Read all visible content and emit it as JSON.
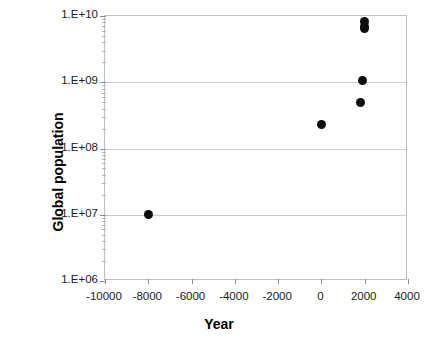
{
  "chart_data": {
    "type": "scatter",
    "title": "",
    "xlabel": "Year",
    "ylabel": "Global population",
    "yscale": "log",
    "xscale": "linear",
    "xlim": [
      -10000,
      4000
    ],
    "ylim": [
      1000000,
      10000000000
    ],
    "grid": true,
    "legend": false,
    "x_tick_labels": [
      "-10000",
      "-8000",
      "-6000",
      "-4000",
      "-2000",
      "0",
      "2000",
      "4000"
    ],
    "x_ticks": [
      -10000,
      -8000,
      -6000,
      -4000,
      -2000,
      0,
      2000,
      4000
    ],
    "y_tick_labels": [
      "1.E+10",
      "1.E+09",
      "1.E+08",
      "1.E+07",
      "1.E+06"
    ],
    "y_ticks": [
      10000000000,
      1000000000,
      100000000,
      10000000,
      1000000
    ],
    "series": [
      {
        "name": "Global population",
        "marker": "filled-circle",
        "color": "#0d0d0d",
        "points": [
          {
            "x": -8000,
            "y": 10000000
          },
          {
            "x": 0,
            "y": 230000000
          },
          {
            "x": 1800,
            "y": 500000000
          },
          {
            "x": 1900,
            "y": 1050000000
          },
          {
            "x": 1990,
            "y": 6400000000
          },
          {
            "x": 2000,
            "y": 7000000000
          },
          {
            "x": 2010,
            "y": 8300000000
          }
        ]
      }
    ]
  },
  "axes": {
    "x_title": "Year",
    "y_title": "Global population"
  }
}
